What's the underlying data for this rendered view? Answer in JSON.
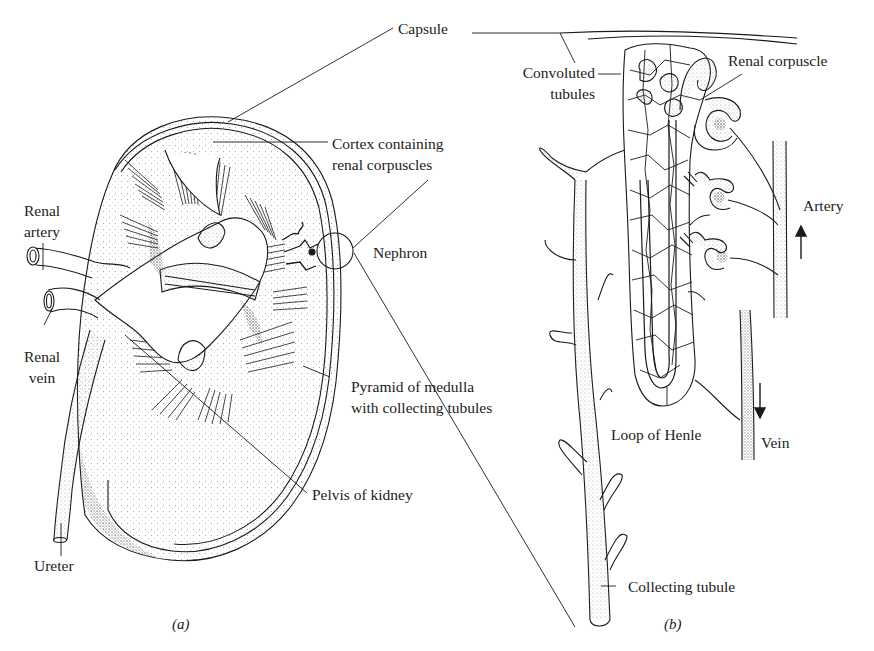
{
  "figure": {
    "panels": [
      {
        "id": "a",
        "label": "(a)",
        "title": "Kidney cross-section"
      },
      {
        "id": "b",
        "label": "(b)",
        "title": "Nephron detail"
      }
    ],
    "labels": {
      "capsule": "Capsule",
      "cortex_line1": "Cortex containing",
      "cortex_line2": "renal corpuscles",
      "renal_artery_line1": "Renal",
      "renal_artery_line2": "artery",
      "renal_vein_line1": "Renal",
      "renal_vein_line2": "vein",
      "nephron": "Nephron",
      "pyramid_line1": "Pyramid of medulla",
      "pyramid_line2": "with collecting tubules",
      "pelvis": "Pelvis of kidney",
      "ureter": "Ureter",
      "convoluted_line1": "Convoluted",
      "convoluted_line2": "tubules",
      "renal_corpuscle": "Renal corpuscle",
      "artery": "Artery",
      "vein": "Vein",
      "loop_of_henle": "Loop of Henle",
      "collecting_tubule": "Collecting tubule"
    },
    "arrows": {
      "artery_direction": "up",
      "vein_direction": "down"
    },
    "colors": {
      "ink": "#1a1a1a",
      "stipple": "#8a8a8a",
      "background": "#ffffff"
    }
  }
}
